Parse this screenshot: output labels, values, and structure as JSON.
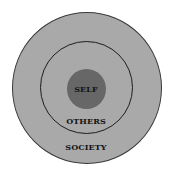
{
  "diagram": {
    "type": "concentric-circles",
    "rings": [
      {
        "id": "society",
        "label": "SOCIETY",
        "fill": "#a9a9a9",
        "stroke": "#3a3a3a"
      },
      {
        "id": "others",
        "label": "OTHERS",
        "fill": "#a9a9a9",
        "stroke": "#1e1e1e"
      },
      {
        "id": "self",
        "label": "SELF",
        "fill": "#676767"
      }
    ],
    "labels": {
      "self": "SELF",
      "others": "OTHERS",
      "society": "SOCIETY"
    },
    "colors": {
      "background": "#ffffff",
      "ring_fill": "#a9a9a9",
      "core_fill": "#676767",
      "text": "#141414"
    }
  }
}
